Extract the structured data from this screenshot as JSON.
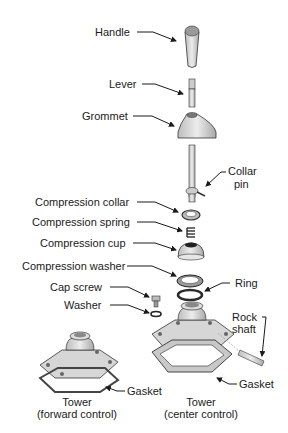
{
  "diagram": {
    "type": "exploded-view",
    "labels": {
      "handle": "Handle",
      "lever": "Lever",
      "grommet": "Grommet",
      "collar_pin_1": "Collar",
      "collar_pin_2": "pin",
      "compression_collar": "Compression collar",
      "compression_spring": "Compression spring",
      "compression_cup": "Compression cup",
      "compression_washer": "Compression washer",
      "ring": "Ring",
      "cap_screw": "Cap screw",
      "washer": "Washer",
      "rock_shaft_1": "Rock",
      "rock_shaft_2": "shaft",
      "gasket_left": "Gasket",
      "gasket_right": "Gasket",
      "tower_forward_1": "Tower",
      "tower_forward_2": "(forward control)",
      "tower_center_1": "Tower",
      "tower_center_2": "(center control)"
    },
    "colors": {
      "part_fill": "#d9d9d9",
      "part_shade": "#a8a8a8",
      "line": "#1a1a1a",
      "dark": "#3a3a3a"
    }
  }
}
